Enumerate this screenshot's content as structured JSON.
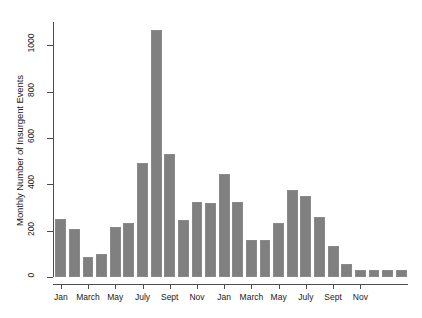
{
  "chart_data": {
    "type": "bar",
    "title": "",
    "subtitle": "",
    "xlabel": "",
    "ylabel": "Monthly Number of Insurgent Events",
    "ylim": [
      0,
      1100
    ],
    "yticks": [
      0,
      200,
      400,
      600,
      800,
      1000
    ],
    "ytick_labels": [
      "0",
      "200",
      "400",
      "600",
      "800",
      "1000"
    ],
    "grid": false,
    "legend": false,
    "bar_color": "#808080",
    "bar_edge_color": "#8a8a8a",
    "axis_color": "#4d4d4d",
    "categories": [
      "Jan",
      "Feb",
      "March",
      "April",
      "May",
      "June",
      "July",
      "Aug",
      "Sept",
      "Oct",
      "Nov",
      "Dec",
      "Jan",
      "Feb",
      "March",
      "April",
      "May",
      "June",
      "July",
      "Aug",
      "Sept",
      "Oct",
      "Nov",
      "Dec",
      "Jan",
      "Feb"
    ],
    "values": [
      250,
      205,
      85,
      100,
      215,
      235,
      490,
      1065,
      530,
      248,
      325,
      320,
      445,
      325,
      160,
      158,
      235,
      375,
      350,
      260,
      135,
      55,
      32,
      30,
      30,
      30
    ],
    "xtick_labels": [
      "Jan",
      "March",
      "May",
      "July",
      "Sept",
      "Nov",
      "Jan",
      "March",
      "May",
      "July",
      "Sept",
      "Nov"
    ],
    "xtick_indices": [
      0,
      2,
      4,
      6,
      8,
      10,
      12,
      14,
      16,
      18,
      20,
      22
    ]
  }
}
